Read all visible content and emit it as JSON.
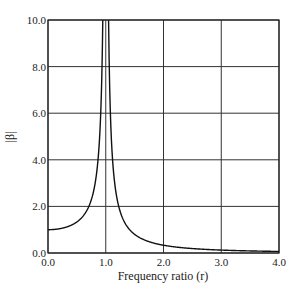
{
  "chart_data": {
    "type": "line",
    "title": "",
    "xlabel": "Frequency ratio (r)",
    "ylabel": "|β|",
    "xlim": [
      0.0,
      4.0
    ],
    "ylim": [
      0.0,
      10.0
    ],
    "grid": true,
    "x_ticks": [
      "0.0",
      "1.0",
      "2.0",
      "3.0",
      "4.0"
    ],
    "y_ticks": [
      "0.0",
      "2.0",
      "4.0",
      "6.0",
      "8.0",
      "10.0"
    ],
    "series": [
      {
        "name": "|β| = 1/|1 - r²| (undamped)",
        "x": [
          0.0,
          0.2,
          0.4,
          0.5,
          0.6,
          0.7,
          0.8,
          0.85,
          0.9,
          0.95,
          1.05,
          1.1,
          1.15,
          1.2,
          1.3,
          1.5,
          1.75,
          2.0,
          2.5,
          3.0,
          3.5,
          4.0
        ],
        "values": [
          1.0,
          1.04,
          1.19,
          1.33,
          1.56,
          1.96,
          2.78,
          3.6,
          5.26,
          10.26,
          10.24,
          4.76,
          3.1,
          2.27,
          1.45,
          0.8,
          0.48,
          0.33,
          0.19,
          0.125,
          0.089,
          0.067
        ]
      }
    ]
  }
}
